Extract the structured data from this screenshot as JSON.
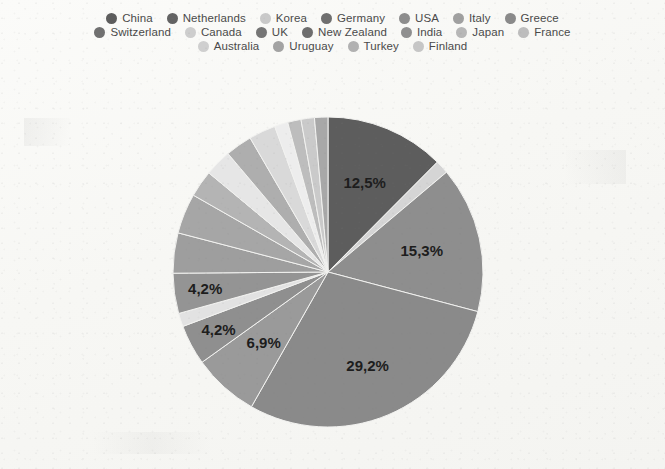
{
  "legend": {
    "rows": [
      [
        {
          "label": "China",
          "color": "#5d5d5d"
        },
        {
          "label": "Netherlands",
          "color": "#636363"
        },
        {
          "label": "Korea",
          "color": "#c9c9c9"
        },
        {
          "label": "Germany",
          "color": "#6f6f6f"
        },
        {
          "label": "USA",
          "color": "#8d8d8d"
        },
        {
          "label": "Italy",
          "color": "#a0a0a0"
        },
        {
          "label": "Greece",
          "color": "#8a8a8a"
        }
      ],
      [
        {
          "label": "Switzerland",
          "color": "#707070"
        },
        {
          "label": "Canada",
          "color": "#cdcdcd"
        },
        {
          "label": "UK",
          "color": "#757575"
        },
        {
          "label": "New Zealand",
          "color": "#6d6d6d"
        },
        {
          "label": "India",
          "color": "#8f8f8f"
        },
        {
          "label": "Japan",
          "color": "#b7b7b7"
        },
        {
          "label": "France",
          "color": "#bdbdbd"
        }
      ],
      [
        {
          "label": "Australia",
          "color": "#cfcfcf"
        },
        {
          "label": "Uruguay",
          "color": "#a3a3a3"
        },
        {
          "label": "Turkey",
          "color": "#b1b1b1"
        },
        {
          "label": "Finland",
          "color": "#c6c6c6"
        }
      ]
    ]
  },
  "chart_data": {
    "type": "pie",
    "title": "",
    "legend_position": "top",
    "start_angle": 0,
    "direction": "clockwise",
    "categories": [
      "China",
      "Netherlands",
      "Korea",
      "Germany",
      "USA",
      "Italy",
      "Greece",
      "Switzerland",
      "Canada",
      "UK",
      "New Zealand",
      "India",
      "Japan",
      "France",
      "Australia",
      "Uruguay",
      "Turkey",
      "Finland"
    ],
    "values": [
      12.5,
      1.4,
      15.3,
      29.2,
      6.9,
      4.2,
      1.4,
      4.2,
      4.2,
      4.2,
      2.8,
      2.8,
      2.8,
      2.8,
      1.4,
      1.4,
      1.4,
      1.4
    ],
    "value_unit": "%",
    "labeled_slices": [
      {
        "category": "China",
        "label": "12,5%",
        "value": 12.5
      },
      {
        "category": "Korea",
        "label": "15,3%",
        "value": 15.3
      },
      {
        "category": "Germany",
        "label": "29,2%",
        "value": 29.2
      },
      {
        "category": "USA",
        "label": "6,9%",
        "value": 6.9
      },
      {
        "category": "Italy",
        "label": "4,2%",
        "value": 4.2
      },
      {
        "category": "Switzerland",
        "label": "4,2%",
        "value": 4.2
      }
    ],
    "slice_colors": [
      "#5d5d5d",
      "#d5d5d5",
      "#8e8e8e",
      "#8a8a8a",
      "#9a9a9a",
      "#8f8f8f",
      "#e2e2e2",
      "#949494",
      "#9e9e9e",
      "#a6a6a6",
      "#b4b4b4",
      "#e6e6e6",
      "#aeaeae",
      "#d9d9d9",
      "#ededed",
      "#bdbdbd",
      "#cacaca",
      "#a8a8a8"
    ]
  },
  "pie_geometry": {
    "center_x": 328,
    "center_y": 194,
    "radius": 155
  },
  "slice_labels": {
    "china": "12,5%",
    "korea": "15,3%",
    "germany": "29,2%",
    "usa": "6,9%",
    "italy": "4,2%",
    "switzerland": "4,2%"
  }
}
